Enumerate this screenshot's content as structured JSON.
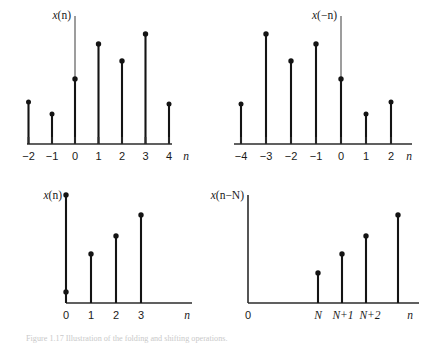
{
  "figure": {
    "caption": "Figure 1.17  Illustration of the folding and shifting operations.",
    "background_color": "#ffffff",
    "stem_color": "#141414",
    "axis_color": "#2b2b2b",
    "axis_color_light": "#7d7d7d"
  },
  "panels": [
    {
      "id": "top-left",
      "signal_label": "x(n)",
      "signal_label_fn": "x",
      "signal_label_arg": "(n)",
      "xaxis_label": "n",
      "ticks": [
        "−2",
        "−1",
        "0",
        "1",
        "2",
        "3",
        "4"
      ],
      "chart": {
        "type": "stem",
        "x": [
          -2,
          -1,
          0,
          1,
          2,
          3,
          4
        ],
        "tick_labels": [
          "−2",
          "−1",
          "0",
          "1",
          "2",
          "3",
          "4"
        ],
        "values": [
          1.9,
          1.4,
          3.0,
          4.6,
          3.8,
          5.1,
          1.8
        ],
        "title": "x(n)",
        "xlabel": "n",
        "ylabel": "x(n)"
      }
    },
    {
      "id": "top-right",
      "signal_label": "x(−n)",
      "signal_label_fn": "x",
      "signal_label_arg": "(−n)",
      "xaxis_label": "n",
      "ticks": [
        "−4",
        "−3",
        "−2",
        "−1",
        "0",
        "1",
        "2"
      ],
      "chart": {
        "type": "stem",
        "x": [
          -4,
          -3,
          -2,
          -1,
          0,
          1,
          2
        ],
        "tick_labels": [
          "−4",
          "−3",
          "−2",
          "−1",
          "0",
          "1",
          "2"
        ],
        "values": [
          1.8,
          5.1,
          3.8,
          4.6,
          3.0,
          1.4,
          1.9
        ],
        "title": "x(−n)",
        "xlabel": "n",
        "ylabel": "x(−n)"
      }
    },
    {
      "id": "bottom-left",
      "signal_label": "x(n)",
      "signal_label_fn": "x",
      "signal_label_arg": "(n)",
      "xaxis_label": "n",
      "ticks": [
        "0",
        "1",
        "2",
        "3"
      ],
      "chart": {
        "type": "stem",
        "x": [
          0,
          1,
          2,
          3
        ],
        "tick_labels": [
          "0",
          "1",
          "2",
          "3"
        ],
        "values": [
          5.2,
          2.4,
          3.3,
          4.4
        ],
        "marker_extra": [
          {
            "x": 0,
            "y": 1.4
          }
        ],
        "title": "x(n)",
        "xlabel": "n",
        "ylabel": "x(n)"
      }
    },
    {
      "id": "bottom-right",
      "signal_label": "x(n−N)",
      "signal_label_fn": "x",
      "signal_label_arg": "(n−N)",
      "xaxis_label": "n",
      "ticks": [
        "0",
        "N",
        "N+1",
        "N+2",
        "n"
      ],
      "chart": {
        "type": "stem",
        "x": [
          "N",
          "N+1",
          "N+2",
          "n"
        ],
        "tick_labels": [
          "N",
          "N+1",
          "N+2",
          "n"
        ],
        "origin_label": "0",
        "values": [
          1.4,
          2.4,
          3.3,
          4.4
        ],
        "title": "x(n−N)",
        "xlabel": "n",
        "ylabel": "x(n−N)"
      }
    }
  ]
}
